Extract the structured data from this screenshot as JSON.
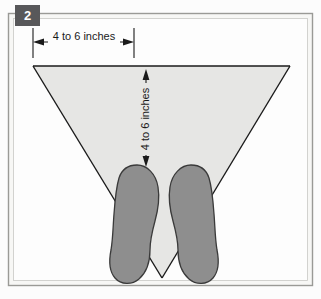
{
  "figure": {
    "step_badge": "2",
    "horizontal_dimension_label": "4 to 6 inches",
    "vertical_dimension_label": "4 to 6 inches",
    "alt_description": "Stance diagram: two feet side by side with a triangle spanning to two marker dots",
    "colors": {
      "page_background": "#fcfcfc",
      "panel_background": "#f7f7f5",
      "panel_border": "#9a9a96",
      "triangle_fill": "#e6e6e4",
      "stroke": "#1a1a1a",
      "foot_fill": "#8e8e8e",
      "foot_stroke": "#3a3a3a",
      "marker_dot": "#161616",
      "badge_background": "#58585a",
      "badge_text": "#ffffff"
    },
    "markers": [
      {
        "name": "left-marker-dot",
        "cx": 33,
        "cy": 66,
        "r": 8
      },
      {
        "name": "right-marker-dot",
        "cx": 290,
        "cy": 66,
        "r": 8
      }
    ],
    "geometry": {
      "triangle_apex_x": 162,
      "triangle_apex_y": 278,
      "horizontal_dim_y": 42,
      "horizontal_dim_x1": 33,
      "horizontal_dim_x2": 134,
      "vertical_dim_x": 146,
      "vertical_dim_y1": 70,
      "vertical_dim_y2": 166
    }
  }
}
